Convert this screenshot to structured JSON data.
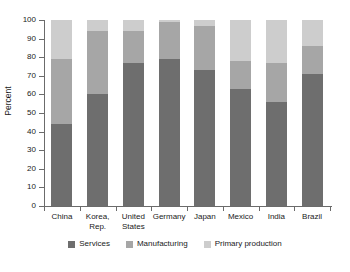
{
  "chart_data": {
    "type": "bar",
    "stacked": true,
    "title": "",
    "xlabel": "",
    "ylabel": "Percent",
    "ylim": [
      0,
      100
    ],
    "yticks": [
      0,
      10,
      20,
      30,
      40,
      50,
      60,
      70,
      80,
      90,
      100
    ],
    "ytick_labels": [
      "0",
      "10",
      "20",
      "30",
      "40",
      "50",
      "60",
      "70",
      "80",
      "90",
      "100"
    ],
    "grid": false,
    "legend_position": "bottom",
    "categories": [
      "China",
      "Korea,\nRep.",
      "United\nStates",
      "Germany",
      "Japan",
      "Mexico",
      "India",
      "Brazil"
    ],
    "series": [
      {
        "name": "Services",
        "color": "#6e6e6e",
        "values": [
          44,
          60,
          77,
          79,
          73,
          63,
          56,
          71
        ]
      },
      {
        "name": "Manufacturing",
        "color": "#a6a6a6",
        "values": [
          35,
          34,
          17,
          20,
          24,
          15,
          21,
          15
        ]
      },
      {
        "name": "Primary production",
        "color": "#cdcdcd",
        "values": [
          21,
          6,
          6,
          1,
          3,
          22,
          23,
          14
        ]
      }
    ],
    "cumulative_tops": {
      "services": [
        44,
        60,
        77,
        79,
        73,
        63,
        56,
        71
      ],
      "manufacturing": [
        79,
        94,
        94,
        99,
        97,
        78,
        77,
        86
      ],
      "primary": [
        100,
        100,
        100,
        100,
        100,
        100,
        100,
        100
      ]
    }
  },
  "legend": {
    "items": [
      {
        "label": "Services",
        "color": "#6e6e6e"
      },
      {
        "label": "Manufacturing",
        "color": "#a6a6a6"
      },
      {
        "label": "Primary production",
        "color": "#cdcdcd"
      }
    ]
  },
  "axes": {
    "y_title": "Percent",
    "axis_color": "#6b6b6b"
  }
}
